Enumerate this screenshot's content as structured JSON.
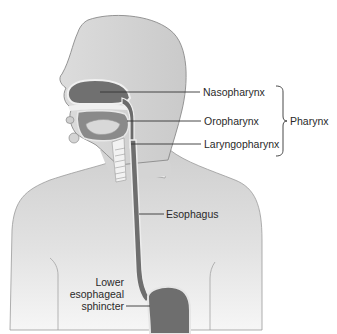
{
  "figure": {
    "colors": {
      "skin": "#d9d9d9",
      "skin_light": "#ececec",
      "outline": "#8a8a8a",
      "cavity": "#6e6e6e",
      "tissue": "#bdbdbd",
      "leader_line": "#333333",
      "text": "#2a2a2a"
    }
  },
  "labels": {
    "nasopharynx": "Nasopharynx",
    "oropharynx": "Oropharynx",
    "laryngopharynx": "Laryngopharynx",
    "pharynx": "Pharynx",
    "esophagus": "Esophagus",
    "les_line1": "Lower",
    "les_line2": "esophageal",
    "les_line3": "sphincter"
  }
}
